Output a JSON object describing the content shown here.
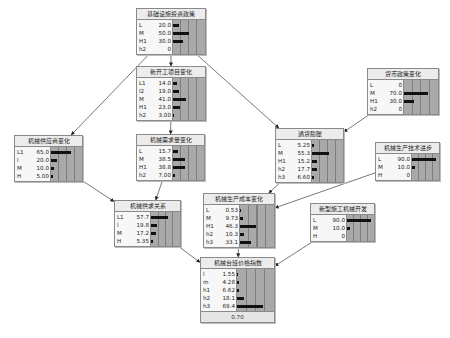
{
  "diagram": {
    "type": "bayesian-network",
    "nodes": [
      {
        "id": "infra_policy",
        "title": "基础设施投资政策",
        "x": 136,
        "y": 8,
        "w": 68,
        "states": [
          {
            "label": "L",
            "value": "20.0",
            "p": 20.0
          },
          {
            "label": "M",
            "value": "50.0",
            "p": 50.0
          },
          {
            "label": "H1",
            "value": "30.0",
            "p": 30.0
          },
          {
            "label": "h2",
            "value": "0",
            "p": 0
          }
        ]
      },
      {
        "id": "new_projects",
        "title": "新开工项目变化",
        "x": 136,
        "y": 66,
        "w": 68,
        "states": [
          {
            "label": "L1",
            "value": "14.0",
            "p": 14.0
          },
          {
            "label": "l2",
            "value": "19.0",
            "p": 19.0
          },
          {
            "label": "M",
            "value": "41.0",
            "p": 41.0
          },
          {
            "label": "H1",
            "value": "23.0",
            "p": 23.0
          },
          {
            "label": "h2",
            "value": "3.00",
            "p": 3.0
          }
        ]
      },
      {
        "id": "monetary_policy",
        "title": "货币政策变化",
        "x": 367,
        "y": 68,
        "w": 70,
        "states": [
          {
            "label": "L",
            "value": "0",
            "p": 0
          },
          {
            "label": "M",
            "value": "70.0",
            "p": 70.0
          },
          {
            "label": "H1",
            "value": "30.0",
            "p": 30.0
          },
          {
            "label": "h2",
            "value": "0",
            "p": 0
          }
        ]
      },
      {
        "id": "supplier_change",
        "title": "机械供应商变化",
        "x": 14,
        "y": 135,
        "w": 67,
        "states": [
          {
            "label": "L1",
            "value": "65.0",
            "p": 65.0
          },
          {
            "label": "l",
            "value": "20.0",
            "p": 20.0
          },
          {
            "label": "M",
            "value": "10.0",
            "p": 10.0
          },
          {
            "label": "H",
            "value": "5.00",
            "p": 5.0
          }
        ]
      },
      {
        "id": "demand_change",
        "title": "机械需求量变化",
        "x": 136,
        "y": 134,
        "w": 67,
        "states": [
          {
            "label": "L",
            "value": "15.7",
            "p": 15.7
          },
          {
            "label": "M",
            "value": "38.5",
            "p": 38.5
          },
          {
            "label": "H1",
            "value": "38.8",
            "p": 38.8
          },
          {
            "label": "h2",
            "value": "7.00",
            "p": 7.0
          }
        ]
      },
      {
        "id": "inflation",
        "title": "通货膨胀",
        "x": 275,
        "y": 128,
        "w": 67,
        "states": [
          {
            "label": "L",
            "value": "5.25",
            "p": 5.25
          },
          {
            "label": "M",
            "value": "55.3",
            "p": 55.3
          },
          {
            "label": "H1",
            "value": "15.2",
            "p": 15.2
          },
          {
            "label": "h2",
            "value": "17.7",
            "p": 17.7
          },
          {
            "label": "h3",
            "value": "6.60",
            "p": 6.6
          }
        ]
      },
      {
        "id": "tech_progress",
        "title": "机械生产技术进步",
        "x": 375,
        "y": 142,
        "w": 63,
        "states": [
          {
            "label": "L",
            "value": "90.0",
            "p": 90.0
          },
          {
            "label": "M",
            "value": "10.0",
            "p": 10.0
          },
          {
            "label": "H",
            "value": "0",
            "p": 0
          }
        ]
      },
      {
        "id": "supply_demand",
        "title": "机械供求关系",
        "x": 114,
        "y": 200,
        "w": 65,
        "states": [
          {
            "label": "L1",
            "value": "57.7",
            "p": 57.7
          },
          {
            "label": "l",
            "value": "19.8",
            "p": 19.8
          },
          {
            "label": "M",
            "value": "17.2",
            "p": 17.2
          },
          {
            "label": "H",
            "value": "5.35",
            "p": 5.35
          }
        ]
      },
      {
        "id": "production_cost",
        "title": "机械生产成本变化",
        "x": 203,
        "y": 193,
        "w": 70,
        "states": [
          {
            "label": "L",
            "value": "0.53",
            "p": 0.53
          },
          {
            "label": "M",
            "value": "9.73",
            "p": 9.73
          },
          {
            "label": "H1",
            "value": "46.3",
            "p": 46.3
          },
          {
            "label": "h2",
            "value": "10.3",
            "p": 10.3
          },
          {
            "label": "h3",
            "value": "33.1",
            "p": 33.1
          }
        ]
      },
      {
        "id": "new_machinery",
        "title": "新型施工机械开发",
        "x": 310,
        "y": 203,
        "w": 63,
        "states": [
          {
            "label": "L",
            "value": "90.0",
            "p": 90.0
          },
          {
            "label": "M",
            "value": "10.0",
            "p": 10.0
          },
          {
            "label": "H",
            "value": "0",
            "p": 0
          }
        ]
      },
      {
        "id": "price_index",
        "title": "机械台班价格指数",
        "x": 200,
        "y": 257,
        "w": 73,
        "states": [
          {
            "label": "l",
            "value": "1.55",
            "p": 1.55
          },
          {
            "label": "m",
            "value": "4.28",
            "p": 4.28
          },
          {
            "label": "h1",
            "value": "6.62",
            "p": 6.62
          },
          {
            "label": "h2",
            "value": "18.1",
            "p": 18.1
          },
          {
            "label": "h3",
            "value": "69.4",
            "p": 69.4
          }
        ],
        "footer": "0.70"
      }
    ],
    "edges": [
      {
        "from": "infra_policy",
        "to": "new_projects"
      },
      {
        "from": "infra_policy",
        "to": "supplier_change"
      },
      {
        "from": "infra_policy",
        "to": "inflation"
      },
      {
        "from": "new_projects",
        "to": "demand_change"
      },
      {
        "from": "monetary_policy",
        "to": "inflation"
      },
      {
        "from": "supplier_change",
        "to": "supply_demand"
      },
      {
        "from": "demand_change",
        "to": "supply_demand"
      },
      {
        "from": "inflation",
        "to": "production_cost"
      },
      {
        "from": "tech_progress",
        "to": "production_cost"
      },
      {
        "from": "supply_demand",
        "to": "price_index"
      },
      {
        "from": "production_cost",
        "to": "price_index"
      },
      {
        "from": "new_machinery",
        "to": "price_index"
      }
    ]
  },
  "colors": {
    "bar": "#111111",
    "bar_bg": "#a9a9a9",
    "node_bg": "#f2f2f2",
    "edge": "#555555"
  }
}
